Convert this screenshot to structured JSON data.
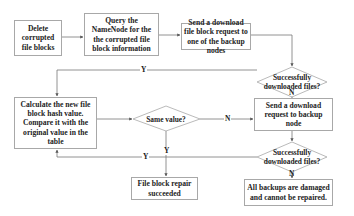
{
  "diagram": {
    "type": "flowchart",
    "nodes": {
      "delete": {
        "label": "Delete corrupted file blocks",
        "shape": "rect"
      },
      "query": {
        "label": "Query the NameNode for the the corrupted file block information",
        "shape": "rect"
      },
      "send_request": {
        "label": "Send a download file block request to one of the backup nodes",
        "shape": "rect"
      },
      "check1": {
        "label": "Successfully downloaded files?",
        "shape": "diamond"
      },
      "calculate": {
        "label": "Calculate the new file block hash value. Compare it with the original value in the table",
        "shape": "rect"
      },
      "same_value": {
        "label": "Same value?",
        "shape": "diamond"
      },
      "send_backup": {
        "label": "Send a download request to backup node",
        "shape": "rect"
      },
      "check2": {
        "label": "Successfully downloaded files?",
        "shape": "diamond"
      },
      "success": {
        "label": "File block repair succeeded",
        "shape": "rect"
      },
      "failure": {
        "label": "All backups are damaged and cannot be repaired.",
        "shape": "rect"
      }
    },
    "edge_labels": {
      "check1_yes": "Y",
      "check1_no": "N",
      "same_no": "N",
      "same_yes": "Y",
      "check2_yes": "Y",
      "check2_no": "N"
    },
    "edges": [
      {
        "from": "delete",
        "to": "query"
      },
      {
        "from": "query",
        "to": "send_request"
      },
      {
        "from": "send_request",
        "to": "check1"
      },
      {
        "from": "check1",
        "to": "calculate",
        "label": "Y"
      },
      {
        "from": "check1",
        "to": "send_backup",
        "label": "N"
      },
      {
        "from": "calculate",
        "to": "same_value"
      },
      {
        "from": "same_value",
        "to": "send_backup",
        "label": "N"
      },
      {
        "from": "same_value",
        "to": "success",
        "label": "Y"
      },
      {
        "from": "send_backup",
        "to": "check2"
      },
      {
        "from": "check2",
        "to": "calculate",
        "label": "Y"
      },
      {
        "from": "check2",
        "to": "failure",
        "label": "N"
      }
    ]
  }
}
